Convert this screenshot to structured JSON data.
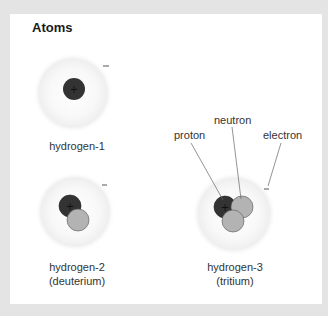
{
  "figure": {
    "title": "Atoms",
    "labels": {
      "proton": "proton",
      "neutron": "neutron",
      "electron": "electron"
    },
    "atoms": [
      {
        "name": "hydrogen-1",
        "subtitle": "",
        "protons": 1,
        "neutrons": 0,
        "electrons": 1
      },
      {
        "name": "hydrogen-2",
        "subtitle": "(deuterium)",
        "protons": 1,
        "neutrons": 1,
        "electrons": 1
      },
      {
        "name": "hydrogen-3",
        "subtitle": "(tritium)",
        "protons": 1,
        "neutrons": 2,
        "electrons": 1
      }
    ],
    "symbols": {
      "proton_charge": "+",
      "electron_charge": "−"
    },
    "colors": {
      "proton": "#333333",
      "neutron": "#b3b3b3",
      "cloud": "#efefef",
      "background": "#e4e4e4",
      "card": "#ffffff"
    }
  }
}
